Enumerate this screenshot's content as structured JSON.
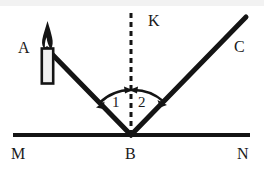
{
  "figure": {
    "kind": "physics-optics-reflection-diagram",
    "canvas": {
      "width": 264,
      "height": 171,
      "background": "#ffffff"
    },
    "stroke_color": "#141414",
    "labels": {
      "source_point": "A",
      "normal": "K",
      "reflected_point": "C",
      "surface_left": "M",
      "vertex": "B",
      "surface_right": "N",
      "angle_incidence": "1",
      "angle_reflection": "2"
    },
    "label_positions": {
      "source_point": {
        "x": 18,
        "y": 40
      },
      "normal": {
        "x": 148,
        "y": 13
      },
      "reflected_point": {
        "x": 234,
        "y": 39
      },
      "surface_left": {
        "x": 11,
        "y": 146
      },
      "vertex": {
        "x": 125,
        "y": 146
      },
      "surface_right": {
        "x": 237,
        "y": 146
      },
      "angle_incidence": {
        "x": 112,
        "y": 95
      },
      "angle_reflection": {
        "x": 138,
        "y": 95
      }
    },
    "geometry": {
      "vertex": {
        "x": 131,
        "y": 135
      },
      "surface_line": {
        "x1": 13,
        "y1": 135,
        "x2": 250,
        "y2": 135,
        "width": 4
      },
      "incident_ray": {
        "x1": 47,
        "y1": 49,
        "x2": 131,
        "y2": 135,
        "width": 5
      },
      "reflected_ray": {
        "x1": 131,
        "y1": 135,
        "x2": 246,
        "y2": 17,
        "width": 5
      },
      "normal_line": {
        "x1": 131,
        "y1": 13,
        "x2": 131,
        "y2": 135,
        "width": 3,
        "dash": "5 4"
      },
      "arc_incidence": {
        "radius": 45,
        "start_deg": 224,
        "end_deg": 270
      },
      "arc_reflection": {
        "radius": 45,
        "start_deg": 270,
        "end_deg": 314
      },
      "candle": {
        "body": {
          "x": 42,
          "y": 49,
          "width": 11,
          "height": 35
        },
        "flame_tip": {
          "x": 47,
          "y": 22
        }
      }
    }
  }
}
